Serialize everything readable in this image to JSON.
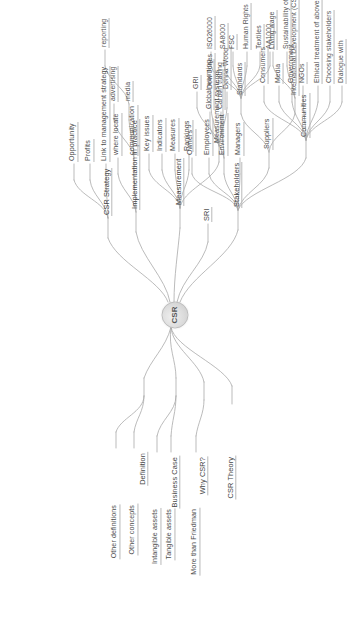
{
  "document": {
    "type": "mind-map",
    "orientation": "rotated-90-counterclockwise",
    "center": {
      "label": "CSR"
    },
    "line_color": "#a8a8a8",
    "text_color": "#4a4a4a",
    "background": "#ffffff"
  },
  "branches": {
    "definition": {
      "label": "Definition",
      "children": [
        {
          "label": "Other definitions"
        },
        {
          "label": "Other concepts"
        }
      ]
    },
    "business_case": {
      "label": "Business Case",
      "children": [
        {
          "label": "Intangible assets"
        },
        {
          "label": "Tangible assets"
        }
      ]
    },
    "why_csr": {
      "label": "Why CSR?",
      "children": [
        {
          "label": "More than Friedman"
        }
      ]
    },
    "csr_theory": {
      "label": "CSR Theory",
      "children": []
    },
    "csr_strategy": {
      "label": "CSR Strategy",
      "children": [
        {
          "label": "Opportunity"
        },
        {
          "label": "Profits"
        },
        {
          "label": "Link to management strategy"
        }
      ]
    },
    "implementation": {
      "label": "Implementation in practice",
      "children": [
        {
          "label": "where locate"
        },
        {
          "label": "communication"
        },
        {
          "label": "advertising"
        },
        {
          "label": "media"
        },
        {
          "label": "reporting"
        }
      ]
    },
    "measurement": {
      "label": "Measurement",
      "children": [
        {
          "label": "Key issues"
        },
        {
          "label": "Indicators"
        },
        {
          "label": "Measures"
        },
        {
          "label": "Rankings"
        },
        {
          "label": "Measurement systems",
          "children": [
            {
              "label": "GRI"
            },
            {
              "label": "Dow Jones"
            },
            {
              "label": "Donna Wood"
            }
          ]
        }
      ]
    },
    "sri": {
      "label": "SRI",
      "children": []
    },
    "stakeholders": {
      "label": "Stakeholders",
      "children": [
        {
          "label": "Owners"
        },
        {
          "label": "Employees"
        },
        {
          "label": "Environment",
          "children": [
            {
              "label": "Global warming"
            },
            {
              "label": "Carbon trading"
            }
          ]
        },
        {
          "label": "Managers"
        },
        {
          "label": "Suppliers",
          "children": [
            {
              "label": "Standards",
              "children": [
                {
                  "label": "ISO26000"
                },
                {
                  "label": "SA8000"
                },
                {
                  "label": "FSC"
                },
                {
                  "label": "Human Rights"
                },
                {
                  "label": "Textiles"
                },
                {
                  "label": "AA1000"
                }
              ]
            },
            {
              "label": "International Development (CSI)",
              "children": [
                {
                  "label": "Living wage"
                },
                {
                  "label": "Sustainability of"
                }
              ]
            }
          ]
        },
        {
          "label": "Communities",
          "children": [
            {
              "label": "Consumers"
            },
            {
              "label": "Media"
            },
            {
              "label": "Government"
            },
            {
              "label": "NGOs"
            },
            {
              "label": "Ethical treatment of above"
            },
            {
              "label": "Choosing stakeholders"
            },
            {
              "label": "Dialogue with"
            }
          ]
        }
      ]
    }
  }
}
